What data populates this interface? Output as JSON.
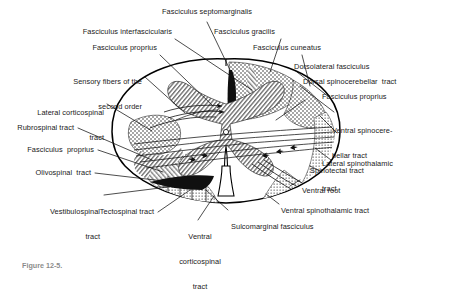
{
  "figure": {
    "kind": "anatomical-diagram",
    "caption": "Figure 12-5.",
    "colors": {
      "ink": "#1a1a1a",
      "outline": "#000000",
      "gray_matter_fill": "#c9c9c9",
      "white_matter_fill": "#ffffff",
      "stipple": "#2b2b2b",
      "page_background": "#ffffff"
    }
  },
  "labels": {
    "left": [
      {
        "id": "fasciculus-interfascicularis",
        "text": "Fasciculus interfascicularis",
        "lines": [
          "Fasciculus interfascicularis"
        ]
      },
      {
        "id": "fasciculus-proprius-upper",
        "text": "Fasciculus proprius",
        "lines": [
          "Fasciculus proprius"
        ]
      },
      {
        "id": "sensory-fibers-second-order",
        "text": "Sensory fibers of the second order",
        "lines": [
          "Sensory fibers of the",
          "second order"
        ]
      },
      {
        "id": "lateral-corticospinal-tract",
        "text": "Lateral corticospinal tract",
        "lines": [
          "Lateral corticospinal",
          "tract"
        ]
      },
      {
        "id": "rubrospinal-tract",
        "text": "Rubrospinal tract",
        "lines": [
          "Rubrospinal tract"
        ]
      },
      {
        "id": "fasciculus-proprius-lower",
        "text": "Fasciculus  proprius",
        "lines": [
          "Fasciculus  proprius"
        ]
      },
      {
        "id": "olivospinal-tract",
        "text": "Olivospinal  tract",
        "lines": [
          "Olivospinal  tract"
        ]
      },
      {
        "id": "vestibulospinal-tract",
        "text": "Vestibulospinal tract",
        "lines": [
          "Vestibulospinal",
          "tract"
        ]
      },
      {
        "id": "tectospinal-tract",
        "text": "Tectospinal tract",
        "lines": [
          "Tectospinal tract"
        ]
      }
    ],
    "top": [
      {
        "id": "fasciculus-septomarginalis",
        "text": "Fasciculus septomarginalis",
        "lines": [
          "Fasciculus septomarginalis"
        ]
      },
      {
        "id": "fasciculus-gracilis",
        "text": "Fasciculus gracilis",
        "lines": [
          "Fasciculus gracilis"
        ]
      },
      {
        "id": "fasciculus-cuneatus",
        "text": "Fasciculus cuneatus",
        "lines": [
          "Fasciculus cuneatus"
        ]
      }
    ],
    "right": [
      {
        "id": "dorsolateral-fasciculus",
        "text": "Dorsolateral fasciculus",
        "lines": [
          "Dorsolateral fasciculus"
        ]
      },
      {
        "id": "dorsal-spinocerebellar-tract",
        "text": "Dorsal spinocerebellar  tract",
        "lines": [
          "Dorsal spinocerebellar  tract"
        ]
      },
      {
        "id": "fasciculus-proprius-right",
        "text": "Fasciculus proprius",
        "lines": [
          "Fasciculus proprius"
        ]
      },
      {
        "id": "ventral-spinocerebellar-tract",
        "text": "Ventral spinocerebellar tract",
        "lines": [
          "Ventral spinocere-",
          "bellar tract"
        ]
      },
      {
        "id": "lateral-spinothalamic-tract",
        "text": "Lateral spinothalamic tract",
        "lines": [
          "Lateral spinothalamic",
          "tract"
        ]
      },
      {
        "id": "spinotectal-tract",
        "text": "Spinotectal tract",
        "lines": [
          "Spinotectal tract"
        ]
      },
      {
        "id": "ventral-root",
        "text": "Ventral root",
        "lines": [
          "Ventral root"
        ]
      },
      {
        "id": "ventral-spinothalamic-tract",
        "text": "Ventral spinothalamic tract",
        "lines": [
          "Ventral spinothalamic tract"
        ]
      },
      {
        "id": "sulcomarginal-fasciculus",
        "text": "Sulcomarginal fasciculus",
        "lines": [
          "Sulcomarginal fasciculus"
        ]
      }
    ],
    "bottom": [
      {
        "id": "ventral-corticospinal-tract",
        "text": "Ventral corticospinal tract",
        "lines": [
          "Ventral",
          "corticospinal",
          "tract"
        ]
      }
    ]
  }
}
